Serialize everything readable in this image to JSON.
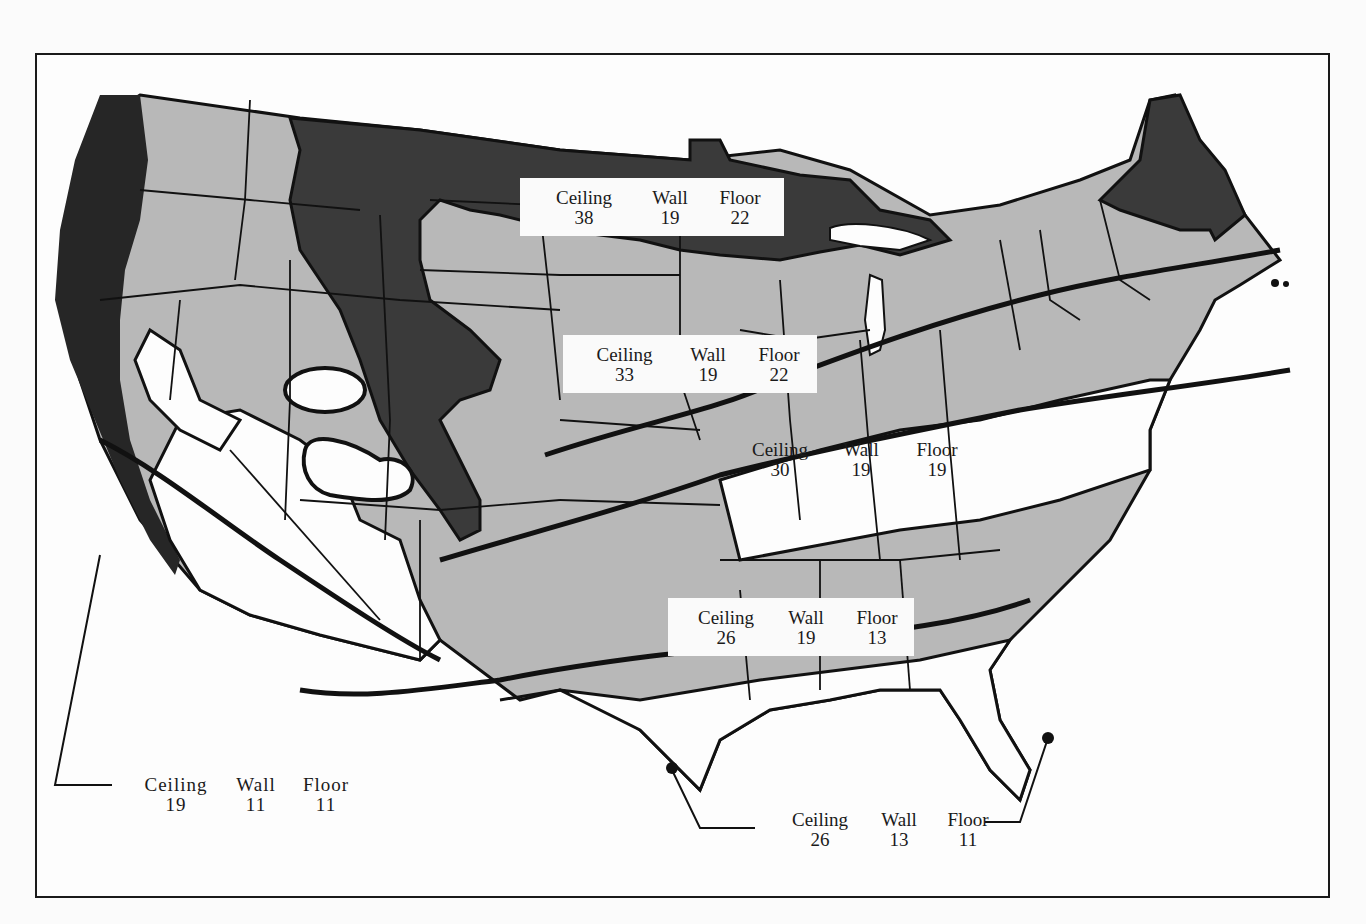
{
  "figure": {
    "type": "insulation-zone-map",
    "region": "Continental United States",
    "colors": {
      "frame": "#1a1a1a",
      "zone_dark": "#3a3a3a",
      "zone_gray": "#b8b8b8",
      "zone_white": "#fdfdfd",
      "border_lines": "#111111"
    },
    "zones": [
      {
        "id": "zone-1",
        "ceiling_label": "Ceiling",
        "ceiling": "38",
        "wall_label": "Wall",
        "wall": "19",
        "floor_label": "Floor",
        "floor": "22"
      },
      {
        "id": "zone-2",
        "ceiling_label": "Ceiling",
        "ceiling": "33",
        "wall_label": "Wall",
        "wall": "19",
        "floor_label": "Floor",
        "floor": "22"
      },
      {
        "id": "zone-3",
        "ceiling_label": "Ceiling",
        "ceiling": "30",
        "wall_label": "Wall",
        "wall": "19",
        "floor_label": "Floor",
        "floor": "19"
      },
      {
        "id": "zone-4",
        "ceiling_label": "Ceiling",
        "ceiling": "26",
        "wall_label": "Wall",
        "wall": "19",
        "floor_label": "Floor",
        "floor": "13"
      },
      {
        "id": "zone-5",
        "ceiling_label": "Ceiling",
        "ceiling": "19",
        "wall_label": "Wall",
        "wall": "11",
        "floor_label": "Floor",
        "floor": "11"
      },
      {
        "id": "zone-6",
        "ceiling_label": "Ceiling",
        "ceiling": "26",
        "wall_label": "Wall",
        "wall": "13",
        "floor_label": "Floor",
        "floor": "11"
      }
    ]
  }
}
